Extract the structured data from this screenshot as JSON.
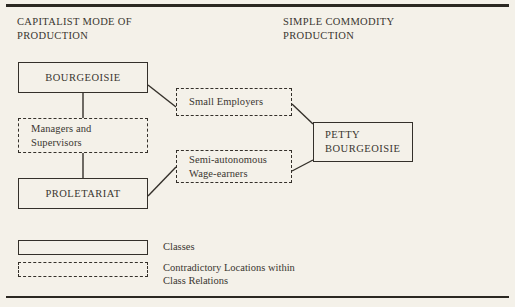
{
  "figure": {
    "headings": {
      "left": "CAPITALIST MODE OF\nPRODUCTION",
      "right": "SIMPLE COMMODITY\nPRODUCTION"
    },
    "nodes": {
      "bourgeoisie": "BOURGEOISIE",
      "managers_supervisors": "Managers and\nSupervisors",
      "proletariat": "PROLETARIAT",
      "small_employers": "Small Employers",
      "semi_autonomous": "Semi-autonomous\nWage-earners",
      "petty_bourgeoisie": "PETTY\nBOURGEOISIE"
    },
    "legend": {
      "classes": "Classes",
      "contradictory": "Contradictory Locations within\nClass Relations"
    },
    "colors": {
      "background": "#f4f1e9",
      "ink": "#34302a",
      "text": "#3a3630"
    }
  }
}
